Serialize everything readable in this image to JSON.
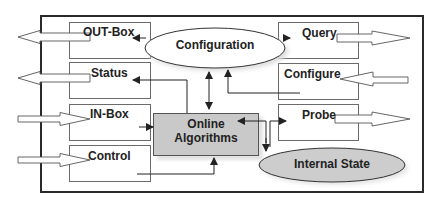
{
  "diagram": {
    "title": "",
    "colors": {
      "frame_border": "#2a2a2a",
      "box_border": "#6a6a6a",
      "algorithms_fill": "#c9c9c9",
      "internal_state_fill": "#cdcdcd",
      "configuration_fill": "#ffffff",
      "arrow": "#222222"
    },
    "boxes": {
      "out_box": "OUT-Box",
      "status": "Status",
      "in_box": "IN-Box",
      "control": "Control",
      "query": "Query",
      "configure": "Configure",
      "probe": "Probe"
    },
    "center": {
      "algorithms_line1": "Online",
      "algorithms_line2": "Algorithms"
    },
    "ellipses": {
      "configuration": "Configuration",
      "internal_state": "Internal State"
    },
    "edges": [
      {
        "from": "OUT-Box",
        "to": "outside",
        "type": "block-arrow"
      },
      {
        "from": "Status",
        "to": "outside",
        "type": "block-arrow"
      },
      {
        "from": "outside",
        "to": "IN-Box",
        "type": "block-arrow"
      },
      {
        "from": "outside",
        "to": "Control",
        "type": "block-arrow"
      },
      {
        "from": "Query",
        "to": "outside",
        "type": "block-arrow"
      },
      {
        "from": "outside",
        "to": "Configure",
        "type": "block-arrow"
      },
      {
        "from": "Probe",
        "to": "outside",
        "type": "block-arrow"
      },
      {
        "from": "Configuration",
        "to": "OUT-Box",
        "type": "line-arrow"
      },
      {
        "from": "Configuration",
        "to": "Query",
        "type": "line-arrow"
      },
      {
        "from": "Online Algorithms",
        "to": "Status",
        "type": "line-arrow"
      },
      {
        "from": "Configure",
        "to": "Configuration",
        "type": "line-arrow"
      },
      {
        "from": "Configuration",
        "to": "Online Algorithms",
        "type": "bidirectional"
      },
      {
        "from": "IN-Box",
        "to": "Online Algorithms",
        "type": "line-arrow"
      },
      {
        "from": "Control",
        "to": "Online Algorithms",
        "type": "line-arrow"
      },
      {
        "from": "Probe",
        "to": "Online Algorithms",
        "type": "bidirectional"
      },
      {
        "from": "Online Algorithms",
        "to": "Internal State",
        "type": "line-arrow"
      }
    ]
  }
}
